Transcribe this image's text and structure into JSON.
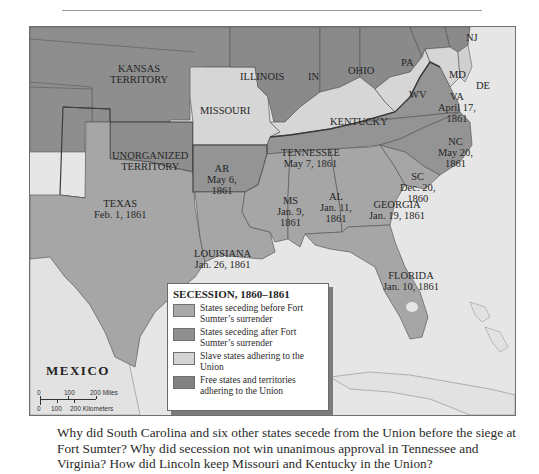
{
  "map": {
    "title": "SECESSION, 1860–1861",
    "colors": {
      "seceded_before": "#a6a6a6",
      "seceded_after": "#949494",
      "slave_union": "#d6d6d6",
      "free_union": "#8a8a8a",
      "water": "#e6e6e6",
      "border_line": "#4a4a4a"
    },
    "labels": {
      "kansas": [
        "KANSAS",
        "TERRITORY"
      ],
      "missouri": [
        "MISSOURI"
      ],
      "illinois": [
        "ILLINOIS"
      ],
      "indiana": [
        "IN"
      ],
      "ohio": [
        "OHIO"
      ],
      "pennsylvania": [
        "PA"
      ],
      "new_jersey": [
        "NJ"
      ],
      "maryland": [
        "MD"
      ],
      "delaware": [
        "DE"
      ],
      "west_virginia": [
        "WV"
      ],
      "virginia": [
        "VA",
        "April 17,",
        "1861"
      ],
      "kentucky": [
        "KENTUCKY"
      ],
      "unorganized": [
        "UNORGANIZED",
        "TERRITORY"
      ],
      "arkansas": [
        "AR",
        "May 6,",
        "1861"
      ],
      "tennessee": [
        "TENNESSEE",
        "May 7, 1861"
      ],
      "north_carolina": [
        "NC",
        "May 20,",
        "1861"
      ],
      "south_carolina": [
        "SC",
        "Dec. 20,",
        "1860"
      ],
      "mississippi": [
        "MS",
        "Jan. 9,",
        "1861"
      ],
      "alabama": [
        "AL",
        "Jan. 11,",
        "1861"
      ],
      "georgia": [
        "GEORGIA",
        "Jan. 19, 1861"
      ],
      "texas": [
        "TEXAS",
        "Feb. 1, 1861"
      ],
      "louisiana": [
        "LOUISIANA",
        "Jan. 26, 1861"
      ],
      "florida": [
        "FLORIDA",
        "Jan. 10, 1861"
      ],
      "mexico": "MEXICO"
    },
    "legend": {
      "title": "SECESSION, 1860–1861",
      "items": [
        {
          "label": "States seceding before Fort Sumter’s surrender",
          "color": "#a9a9a9"
        },
        {
          "label": "States seceding after Fort Sumter’s surrender",
          "color": "#8f8f8f"
        },
        {
          "label": "Slave states adhering to the Union",
          "color": "#d4d4d4"
        },
        {
          "label": "Free states and territories adhering to the Union",
          "color": "#828282"
        }
      ]
    },
    "scale": {
      "miles_ticks": [
        "0",
        "100",
        "200 Miles"
      ],
      "km_ticks": [
        "0",
        "100",
        "200 Kilometers"
      ]
    }
  },
  "caption": "Why did South Carolina and six other states secede from the Union before the siege at Fort Sumter? Why did secession not win unanimous approval in Tennessee and Virginia? How did Lincoln keep Missouri and Kentucky in the Union?"
}
